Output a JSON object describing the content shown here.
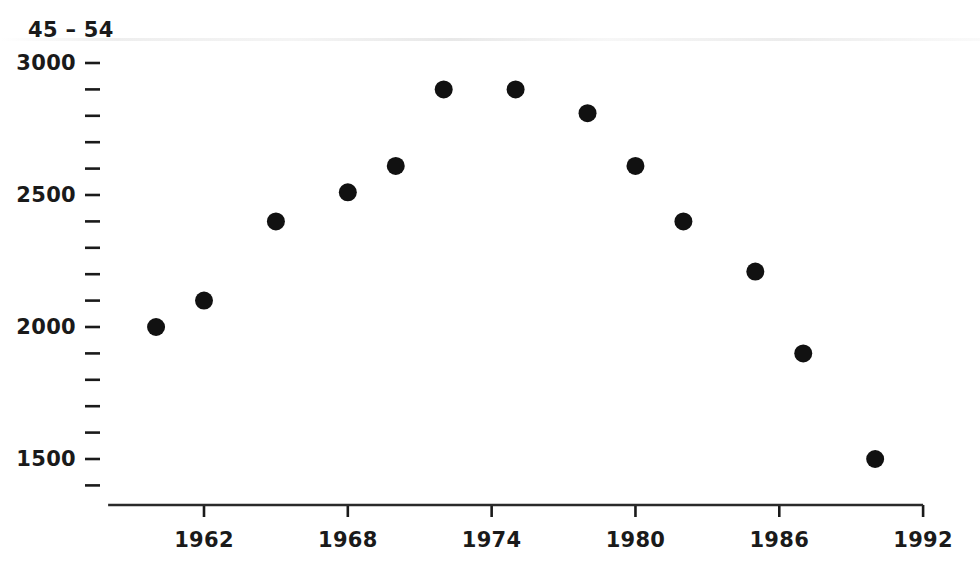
{
  "chart_data": {
    "type": "scatter",
    "title": "45 – 54",
    "xlabel": "",
    "ylabel": "",
    "x": [
      1960,
      1962,
      1965,
      1968,
      1970,
      1972,
      1975,
      1978,
      1980,
      1982,
      1985,
      1987,
      1990
    ],
    "values": [
      2000,
      2100,
      2400,
      2510,
      2610,
      2900,
      2900,
      2810,
      2610,
      2400,
      2210,
      1900,
      1500
    ],
    "points": [
      {
        "x": 1960,
        "y": 2000
      },
      {
        "x": 1962,
        "y": 2100
      },
      {
        "x": 1965,
        "y": 2400
      },
      {
        "x": 1968,
        "y": 2510
      },
      {
        "x": 1970,
        "y": 2610
      },
      {
        "x": 1972,
        "y": 2900
      },
      {
        "x": 1975,
        "y": 2900
      },
      {
        "x": 1978,
        "y": 2810
      },
      {
        "x": 1980,
        "y": 2610
      },
      {
        "x": 1982,
        "y": 2400
      },
      {
        "x": 1985,
        "y": 2210
      },
      {
        "x": 1987,
        "y": 1900
      },
      {
        "x": 1990,
        "y": 1500
      }
    ],
    "xlim": [
      1958,
      1992
    ],
    "ylim": [
      1400,
      3040
    ],
    "x_ticks": [
      1962,
      1968,
      1974,
      1980,
      1986,
      1992
    ],
    "x_tick_labels": [
      "1962",
      "1968",
      "1974",
      "1980",
      "1986",
      "1992"
    ],
    "y_ticks": [
      1400,
      1500,
      1600,
      1700,
      1800,
      1900,
      2000,
      2100,
      2200,
      2300,
      2400,
      2500,
      2600,
      2700,
      2800,
      2900,
      3000
    ],
    "y_labeled_ticks": [
      1500,
      2000,
      2500,
      3000
    ],
    "y_tick_labels": [
      "1500",
      "2000",
      "2500",
      "3000"
    ],
    "grid": false,
    "legend": null,
    "marker": {
      "shape": "circle",
      "color": "#111111",
      "size": 18
    },
    "axis_color": "#2a2a2a",
    "background": "#ffffff"
  }
}
